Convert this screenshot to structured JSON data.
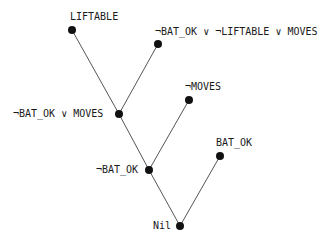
{
  "diagram": {
    "type": "resolution-refutation-tree",
    "nodes": [
      {
        "id": "liftable",
        "label": "LIFTABLE",
        "x": 72,
        "y": 30
      },
      {
        "id": "clause3",
        "label": "¬BAT_OK ∨ ¬LIFTABLE ∨ MOVES",
        "x": 158,
        "y": 44
      },
      {
        "id": "clause2",
        "label": "¬BAT_OK ∨ MOVES",
        "x": 119,
        "y": 114
      },
      {
        "id": "not_moves",
        "label": "¬MOVES",
        "x": 189,
        "y": 100
      },
      {
        "id": "not_bat_ok",
        "label": "¬BAT_OK",
        "x": 149,
        "y": 170
      },
      {
        "id": "bat_ok",
        "label": "BAT_OK",
        "x": 220,
        "y": 156
      },
      {
        "id": "nil",
        "label": "Nil",
        "x": 180,
        "y": 226
      }
    ],
    "edges": [
      {
        "from": "liftable",
        "to": "clause2"
      },
      {
        "from": "clause3",
        "to": "clause2"
      },
      {
        "from": "clause2",
        "to": "not_bat_ok"
      },
      {
        "from": "not_moves",
        "to": "not_bat_ok"
      },
      {
        "from": "not_bat_ok",
        "to": "nil"
      },
      {
        "from": "bat_ok",
        "to": "nil"
      }
    ]
  }
}
